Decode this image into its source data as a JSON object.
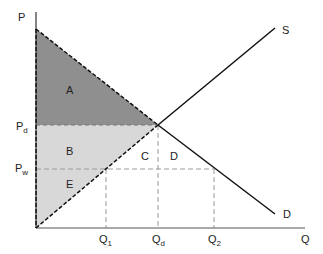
{
  "diagram": {
    "type": "supply-demand-welfare",
    "axes": {
      "y_label": "P",
      "x_label": "Q"
    },
    "curves": {
      "supply_label": "S",
      "demand_label": "D"
    },
    "price_labels": {
      "pd": {
        "main": "P",
        "sub": "d"
      },
      "pw": {
        "main": "P",
        "sub": "w"
      }
    },
    "quantity_labels": {
      "q1": {
        "main": "Q",
        "sub": "1"
      },
      "qd": {
        "main": "Q",
        "sub": "d"
      },
      "q2": {
        "main": "Q",
        "sub": "2"
      }
    },
    "regions": {
      "a": "A",
      "b": "B",
      "c": "C",
      "d": "D",
      "e": "E"
    },
    "colors": {
      "region_a": "#8f8f8f",
      "region_be": "#d8d8d8",
      "line": "#111111",
      "dashed": "#9a9a9a"
    }
  }
}
